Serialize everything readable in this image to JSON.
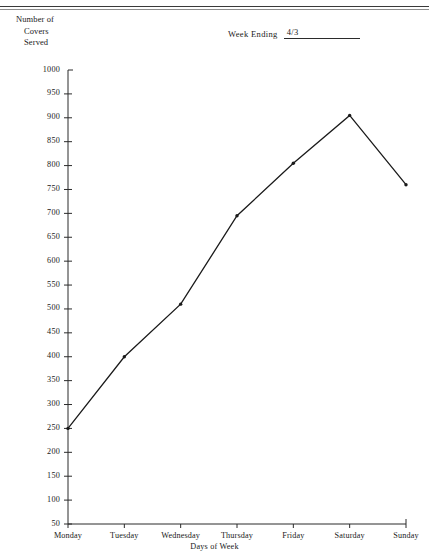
{
  "header": {
    "rule": "horizontal-rule"
  },
  "y_caption": {
    "line1": "Number of",
    "line2": "Covers",
    "line3": "Served"
  },
  "week_ending": {
    "label": "Week Ending",
    "value": "4/3"
  },
  "chart_data": {
    "type": "line",
    "title": "",
    "categories": [
      "Monday",
      "Tuesday",
      "Wednesday",
      "Thursday",
      "Friday",
      "Saturday",
      "Sunday"
    ],
    "values": [
      250,
      400,
      510,
      695,
      805,
      905,
      760
    ],
    "xlabel": "Days of Week",
    "ylabel": "Number of Covers Served",
    "ylim": [
      50,
      1000
    ],
    "ytick_step": 50,
    "ytick_labels": [
      "1000",
      "950",
      "900",
      "850",
      "800",
      "750",
      "700",
      "650",
      "600",
      "550",
      "500",
      "450",
      "400",
      "350",
      "300",
      "250",
      "200",
      "150",
      "100",
      "50"
    ],
    "grid": false,
    "legend": false,
    "marker": "dot",
    "line_color": "#1a1a1a"
  }
}
